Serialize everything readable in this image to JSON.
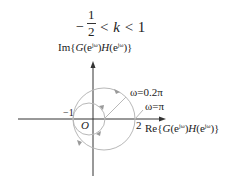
{
  "title": {
    "minus": "−",
    "numerator": "1",
    "denominator": "2",
    "inequality_left": "<",
    "variable": "k",
    "inequality_right": "< 1"
  },
  "axes": {
    "imag_label_prefix": "Im{",
    "imag_label_G": "G",
    "imag_label_body": "(e",
    "imag_label_sup": "jω",
    "imag_label_mid": ")",
    "imag_label_H": "H",
    "imag_label_body2": "(e",
    "imag_label_sup2": "jω",
    "imag_label_end": ")}",
    "real_label_prefix": "Re{",
    "real_label_G": "G",
    "real_label_body": "(e",
    "real_label_sup": "jω",
    "real_label_mid": ")",
    "real_label_H": "H",
    "real_label_body2": "(e",
    "real_label_sup2": "jω",
    "real_label_end": ")}",
    "origin_label": "O",
    "tick_minus_one": "−1",
    "tick_two": "2"
  },
  "annotations": {
    "omega_02pi": "ω=0.2π",
    "omega_pi": "ω=π"
  },
  "colors": {
    "axis": "#333333",
    "curve": "#b5b5b5",
    "text": "#222222"
  }
}
